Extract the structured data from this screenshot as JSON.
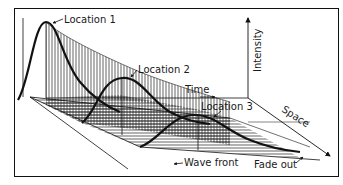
{
  "diagram": {
    "labels": {
      "location1": "Location 1",
      "location2": "Location 2",
      "location3": "Location 3",
      "intensity": "Intensity",
      "time": "Time",
      "space": "Space",
      "wave_front": "Wave front",
      "fade_out": "Fade out"
    },
    "colors": {
      "line": "#111111",
      "hatch": "#222222",
      "background": "#ffffff"
    }
  }
}
